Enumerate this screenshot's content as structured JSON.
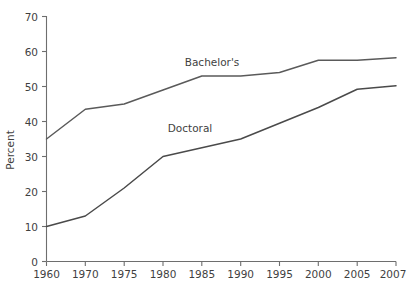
{
  "chart_data": {
    "type": "line",
    "title": "",
    "xlabel": "",
    "ylabel": "Percent",
    "categories": [
      "1960",
      "1970",
      "1975",
      "1980",
      "1985",
      "1990",
      "1995",
      "2000",
      "2005",
      "2007"
    ],
    "ylim": [
      0,
      70
    ],
    "yticks": [
      0,
      10,
      20,
      30,
      40,
      50,
      60,
      70
    ],
    "ytick_labels": [
      "0",
      "10",
      "20",
      "30",
      "40",
      "50",
      "60",
      "70"
    ],
    "grid": false,
    "legend_position": "inline-annotation",
    "series": [
      {
        "name": "Bachelor's",
        "color": "#5a5a5a",
        "values": [
          35.0,
          43.5,
          45.0,
          49.0,
          53.0,
          53.0,
          54.0,
          57.5,
          57.5,
          58.2
        ],
        "label": "Bachelor's",
        "label_x": "1985",
        "label_y": 57.5
      },
      {
        "name": "Doctoral",
        "color": "#4a4a4a",
        "values": [
          10.0,
          13.0,
          21.0,
          30.0,
          32.5,
          35.0,
          39.5,
          44.0,
          49.2,
          50.2
        ],
        "label": "Doctoral",
        "label_x": "1982.5",
        "label_y": 38.0
      }
    ]
  },
  "axes": {
    "y_title": "Percent",
    "y_tick_labels": [
      "70",
      "60",
      "50",
      "40",
      "30",
      "20",
      "10",
      "0"
    ],
    "x_tick_labels": [
      "1960",
      "1970",
      "1975",
      "1980",
      "1985",
      "1990",
      "1995",
      "2000",
      "2005",
      "2007"
    ]
  },
  "annotations": {
    "bachelors_label": "Bachelor's",
    "doctoral_label": "Doctoral"
  },
  "colors": {
    "axis": "#6e6e6e",
    "text": "#3f3f3f",
    "bachelors_line": "#5a5a5a",
    "doctoral_line": "#4a4a4a",
    "background": "#ffffff"
  }
}
